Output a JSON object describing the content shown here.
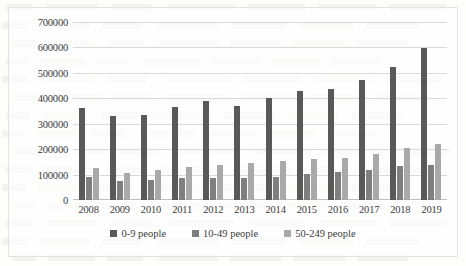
{
  "chart_data": {
    "type": "bar",
    "title": "",
    "subtitle": "",
    "xlabel": "",
    "ylabel": "",
    "grid": true,
    "legend_position": "bottom",
    "categories": [
      "2008",
      "2009",
      "2010",
      "2011",
      "2012",
      "2013",
      "2014",
      "2015",
      "2016",
      "2017",
      "2018",
      "2019"
    ],
    "ylim": [
      0,
      700000
    ],
    "yticks": [
      0,
      100000,
      200000,
      300000,
      400000,
      500000,
      600000,
      700000
    ],
    "ytick_labels": [
      "0",
      "100000",
      "200000",
      "300000",
      "400000",
      "500000",
      "600000",
      "700000"
    ],
    "series": [
      {
        "name": "0-9 people",
        "color": "#595959",
        "values": [
          362000,
          330000,
          335000,
          367000,
          390000,
          370000,
          400000,
          428000,
          437000,
          473000,
          523000,
          599000
        ]
      },
      {
        "name": "10-49 people",
        "color": "#7f7f7f",
        "values": [
          89000,
          73000,
          79000,
          85000,
          85000,
          85000,
          89000,
          103000,
          110000,
          120000,
          133000,
          136000
        ]
      },
      {
        "name": "50-249 people",
        "color": "#a9a9a9",
        "values": [
          124000,
          107000,
          117000,
          128000,
          136000,
          146000,
          152000,
          161000,
          165000,
          182000,
          205000,
          219000
        ]
      }
    ]
  },
  "legend": {
    "items": [
      {
        "label": "0-9 people",
        "color": "#595959"
      },
      {
        "label": "10-49 people",
        "color": "#7f7f7f"
      },
      {
        "label": "50-249 people",
        "color": "#a9a9a9"
      }
    ]
  }
}
